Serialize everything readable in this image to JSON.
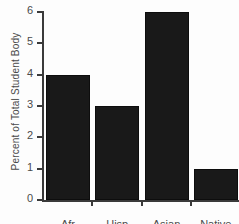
{
  "chart_data": {
    "type": "bar",
    "title": "STUDENT POPULATION",
    "title_truncated": true,
    "xlabel": "",
    "ylabel": "Percent of Total Student Body",
    "categories": [
      "Afr",
      "Hisp",
      "Asian",
      "Native"
    ],
    "values": [
      4,
      3,
      6,
      1
    ],
    "ylim": [
      0,
      6
    ],
    "yticks": [
      "0",
      "1",
      "2",
      "3",
      "4",
      "5",
      "6"
    ],
    "grid": false,
    "legend": false,
    "bar_color": "#191919",
    "axis_color": "#3a3a3a",
    "background": "#fdfdfd"
  }
}
